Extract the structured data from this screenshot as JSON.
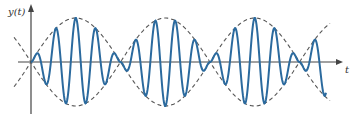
{
  "chart_data": {
    "type": "line",
    "title": "",
    "xlabel": "t",
    "ylabel": "y(t)",
    "grid": false,
    "legend": null,
    "series": [
      {
        "name": "y(t) = A sin(w_m t) sin(w_c t)",
        "style": "solid",
        "color": "#2b6a9e",
        "envelope_cycles_half": 3,
        "carrier_cycles_per_lobe": 4
      },
      {
        "name": "envelope +/- A|sin(w_m t)|",
        "style": "dashed",
        "color": "#555555"
      }
    ],
    "annotations": []
  },
  "labels": {
    "y_axis": "y(t)",
    "x_axis": "t"
  },
  "colors": {
    "signal": "#2b6a9e",
    "envelope": "#555555",
    "axis": "#444444"
  }
}
